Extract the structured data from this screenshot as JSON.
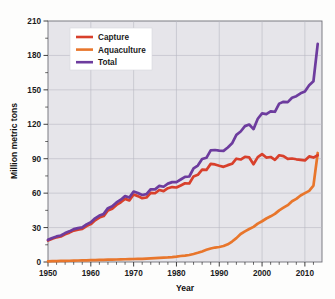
{
  "chart_data": {
    "type": "line",
    "title": "",
    "subtitle": "",
    "xlabel": "Year",
    "ylabel": "Million metric tons",
    "xlim": [
      1950,
      2014
    ],
    "ylim": [
      0,
      210
    ],
    "yticks": [
      0,
      30,
      60,
      90,
      120,
      150,
      180,
      210
    ],
    "ytick_labels": [
      "0",
      "30",
      "60",
      "90",
      "120",
      "150",
      "180",
      "210"
    ],
    "yticks_minor": [
      15,
      45,
      75,
      105,
      135,
      165,
      195
    ],
    "xticks": [
      1950,
      1960,
      1970,
      1980,
      1990,
      2000,
      2010
    ],
    "xtick_labels": [
      "1950",
      "1960",
      "1970",
      "1980",
      "1990",
      "2000",
      "2010"
    ],
    "grid": true,
    "grid_axis": "both",
    "legend_position": "upper-left",
    "legend_entries": [
      "Capture",
      "Aquaculture",
      "Total"
    ],
    "colors": {
      "capture": "#D8402C",
      "aquaculture": "#E8762C",
      "total": "#6D3C9E",
      "plot_background": "#e6e5ea",
      "figure_background": "#fdfdfc",
      "gridline": "#b9b9c2",
      "frame": "#6f6f78",
      "text": "#1b1b1b"
    },
    "x": [
      1950,
      1951,
      1952,
      1953,
      1954,
      1955,
      1956,
      1957,
      1958,
      1959,
      1960,
      1961,
      1962,
      1963,
      1964,
      1965,
      1966,
      1967,
      1968,
      1969,
      1970,
      1971,
      1972,
      1973,
      1974,
      1975,
      1976,
      1977,
      1978,
      1979,
      1980,
      1981,
      1982,
      1983,
      1984,
      1985,
      1986,
      1987,
      1988,
      1989,
      1990,
      1991,
      1992,
      1993,
      1994,
      1995,
      1996,
      1997,
      1998,
      1999,
      2000,
      2001,
      2002,
      2003,
      2004,
      2005,
      2006,
      2007,
      2008,
      2009,
      2010,
      2011,
      2012,
      2013
    ],
    "series": [
      {
        "name": "Capture",
        "color": "#D8402C",
        "values": [
          18.7,
          20.3,
          21.5,
          22.2,
          24.2,
          25.6,
          27.4,
          28.2,
          28.8,
          31.3,
          33.0,
          36.4,
          38.7,
          40.0,
          44.9,
          46.4,
          49.7,
          52.0,
          55.0,
          53.7,
          58.8,
          57.4,
          55.6,
          56.2,
          60.2,
          59.9,
          62.7,
          61.8,
          64.3,
          65.3,
          64.9,
          66.7,
          68.6,
          68.4,
          74.6,
          76.0,
          80.5,
          80.2,
          85.5,
          85.0,
          83.9,
          82.9,
          84.4,
          85.6,
          90.0,
          89.3,
          91.7,
          91.1,
          85.2,
          91.4,
          94.0,
          91.0,
          91.5,
          89.0,
          93.0,
          92.3,
          89.8,
          90.2,
          89.5,
          89.0,
          88.5,
          92.0,
          91.0,
          93.0
        ]
      },
      {
        "name": "Aquaculture",
        "color": "#E8762C",
        "values": [
          0.6,
          0.7,
          0.8,
          0.9,
          1.0,
          1.1,
          1.2,
          1.3,
          1.4,
          1.5,
          1.6,
          1.7,
          1.8,
          1.9,
          2.0,
          2.1,
          2.2,
          2.3,
          2.4,
          2.5,
          2.6,
          2.7,
          2.8,
          3.0,
          3.2,
          3.4,
          3.6,
          3.8,
          4.0,
          4.3,
          4.7,
          5.2,
          5.6,
          6.1,
          7.0,
          8.0,
          9.2,
          10.6,
          11.8,
          12.6,
          13.1,
          13.9,
          15.4,
          17.8,
          20.8,
          24.4,
          26.7,
          28.7,
          30.6,
          33.4,
          35.5,
          37.9,
          39.8,
          41.9,
          45.0,
          47.3,
          49.5,
          52.9,
          55.0,
          58.0,
          60.0,
          62.0,
          66.5,
          95.0
        ]
      },
      {
        "name": "Total",
        "color": "#6D3C9E",
        "values": [
          19.3,
          21.0,
          22.3,
          23.1,
          25.2,
          26.7,
          28.6,
          29.5,
          30.2,
          32.8,
          34.6,
          38.1,
          40.5,
          41.9,
          46.9,
          48.5,
          51.9,
          54.3,
          57.4,
          56.2,
          61.4,
          60.1,
          58.4,
          59.2,
          63.4,
          63.3,
          66.3,
          65.6,
          68.3,
          69.6,
          69.6,
          71.9,
          74.2,
          74.5,
          81.6,
          84.0,
          89.7,
          90.8,
          97.3,
          97.6,
          97.0,
          96.8,
          99.8,
          103.4,
          110.8,
          113.7,
          118.4,
          119.8,
          115.8,
          124.8,
          129.5,
          128.9,
          131.3,
          130.9,
          138.0,
          139.6,
          139.3,
          143.1,
          144.5,
          147.0,
          148.5,
          154.0,
          157.5,
          190.0
        ]
      }
    ]
  },
  "axes": {
    "y_title": "Million metric tons",
    "x_title": "Year"
  },
  "legend": {
    "items": [
      {
        "label": "Capture",
        "color": "#D8402C"
      },
      {
        "label": "Aquaculture",
        "color": "#E8762C"
      },
      {
        "label": "Total",
        "color": "#6D3C9E"
      }
    ]
  }
}
